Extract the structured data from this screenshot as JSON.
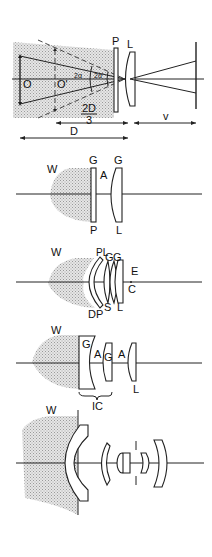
{
  "figure": {
    "panels": [
      {
        "id": "panel-1-geometry",
        "labels": {
          "object": "O",
          "virtual_object": "O'",
          "angle_outer": "2α",
          "angle_inner": "2α'",
          "port": "P",
          "lens": "L",
          "two_d_over_three_num": "2D",
          "two_d_over_three_den": "3",
          "distance": "D",
          "image_distance": "v"
        }
      },
      {
        "id": "panel-2-flat-port",
        "labels": {
          "water": "W",
          "glass_port": "G",
          "air": "A",
          "glass_lens": "G",
          "port": "P",
          "lens": "L"
        }
      },
      {
        "id": "panel-3-dome-port",
        "labels": {
          "water": "W",
          "pl": "PL",
          "g1": "G",
          "g2": "G",
          "eye": "E",
          "center": "C",
          "dome_port": "DP",
          "s": "S",
          "lens": "L"
        }
      },
      {
        "id": "panel-4-corrector",
        "labels": {
          "water": "W",
          "g1": "G",
          "a1": "A",
          "g2": "G",
          "a2": "A",
          "lens": "L",
          "corrector": "IC"
        }
      },
      {
        "id": "panel-5-wide-dome",
        "labels": {
          "water": "W"
        }
      }
    ],
    "colors": {
      "line": "#222222",
      "shading": "#bdbdbd",
      "background": "#ffffff"
    }
  }
}
